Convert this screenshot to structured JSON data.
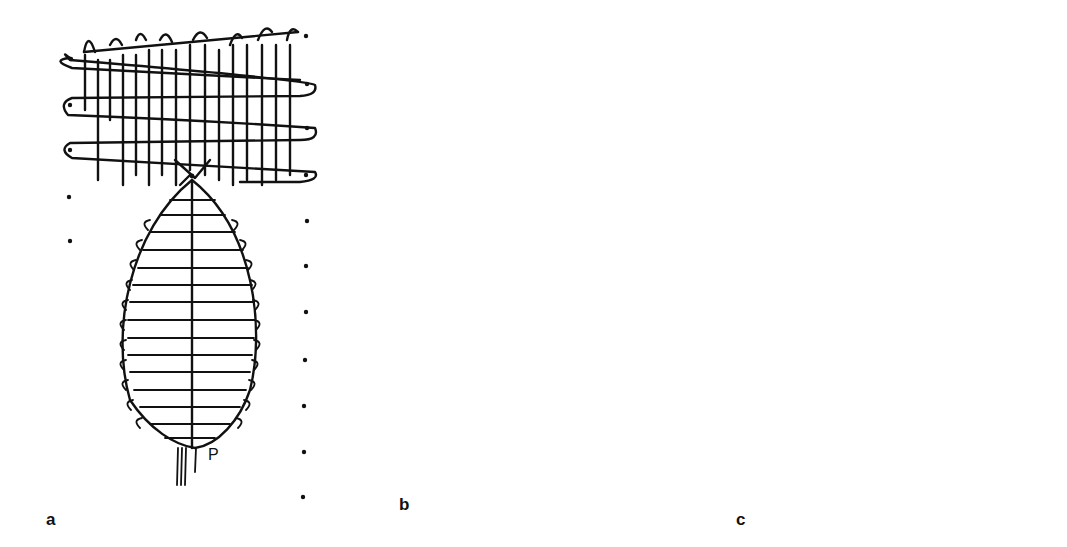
{
  "figure": {
    "panels": [
      {
        "id": "a",
        "label": "a",
        "annotation": "P",
        "description": "Weft wrapping around warp threads forming an elliptical tapestry shape below a woven band"
      },
      {
        "id": "b",
        "label": "b",
        "description": "Detail of crossing warp threads with tie point"
      },
      {
        "id": "c",
        "label": "c",
        "description": "Elliptical wrapped shape embedded within a full woven band"
      }
    ],
    "colors": {
      "ink": "#111111",
      "background": "#ffffff"
    }
  }
}
